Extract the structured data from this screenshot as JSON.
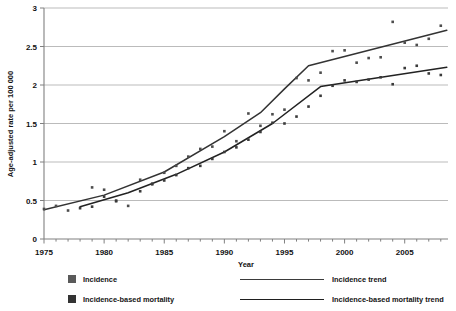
{
  "chart_data": {
    "type": "scatter",
    "title": "",
    "xlabel": "Year",
    "ylabel": "Age-adjusted rate per 100 000",
    "xlim": [
      1975,
      2008.6
    ],
    "ylim": [
      0,
      3
    ],
    "ytick_values": [
      0,
      0.5,
      1,
      1.5,
      2,
      2.5,
      3
    ],
    "ytick_labels": [
      "0",
      "0.5",
      "1",
      "1.5",
      "2",
      "2.5",
      "3"
    ],
    "xtick_values": [
      1975,
      1980,
      1985,
      1990,
      1995,
      2000,
      2005
    ],
    "xtick_labels": [
      "1975",
      "1980",
      "1985",
      "1990",
      "1995",
      "2000",
      "2005"
    ],
    "x_minor_step": 1,
    "grid": "horizontal",
    "legend_position": "bottom",
    "colors": {
      "incidence_marker": "#4d4d4d",
      "mortality_marker": "#3a3a3a",
      "incidence_trend": "#333333",
      "mortality_trend": "#222222",
      "gridline": "#b3b3b3",
      "axis": "#808080",
      "background": "#ffffff"
    },
    "series": [
      {
        "name": "Incidence",
        "kind": "scatter",
        "x": [
          1975,
          1976,
          1977,
          1979,
          1980,
          1981,
          1982,
          1983,
          1984,
          1985,
          1986,
          1987,
          1988,
          1989,
          1990,
          1991,
          1992,
          1993,
          1994,
          1995,
          1996,
          1997,
          1998,
          1999,
          2000,
          2001,
          2002,
          2003,
          2004,
          2005,
          2006,
          2007,
          2008
        ],
        "y": [
          0.39,
          0.43,
          0.37,
          0.67,
          0.64,
          0.5,
          0.43,
          0.77,
          0.72,
          0.86,
          0.95,
          1.07,
          1.17,
          1.2,
          1.4,
          1.27,
          1.63,
          1.47,
          1.62,
          1.68,
          2.09,
          2.06,
          2.16,
          2.44,
          2.45,
          2.29,
          2.35,
          2.36,
          2.82,
          2.55,
          2.52,
          2.6,
          2.77
        ]
      },
      {
        "name": "Incidence-based mortality",
        "kind": "scatter",
        "x": [
          1978,
          1979,
          1980,
          1981,
          1983,
          1984,
          1985,
          1986,
          1987,
          1988,
          1989,
          1990,
          1991,
          1992,
          1993,
          1994,
          1995,
          1996,
          1997,
          1998,
          1999,
          2000,
          2001,
          2002,
          2003,
          2004,
          2005,
          2006,
          2007,
          2008
        ],
        "y": [
          0.4,
          0.42,
          0.55,
          0.49,
          0.62,
          0.71,
          0.76,
          0.83,
          0.92,
          0.95,
          1.04,
          1.13,
          1.19,
          1.29,
          1.39,
          1.51,
          1.5,
          1.59,
          1.72,
          1.86,
          1.99,
          2.06,
          2.04,
          2.07,
          2.1,
          2.01,
          2.22,
          2.25,
          2.15,
          2.13
        ]
      },
      {
        "name": "Incidence trend",
        "kind": "line",
        "x": [
          1975,
          1980,
          1985,
          1990,
          1993,
          1995,
          1997,
          2008.5
        ],
        "y": [
          0.38,
          0.57,
          0.87,
          1.33,
          1.64,
          1.95,
          2.25,
          2.71
        ]
      },
      {
        "name": "Incidence-based mortality trend",
        "kind": "line",
        "x": [
          1978,
          1982,
          1986,
          1990,
          1994,
          1998,
          2008.5
        ],
        "y": [
          0.42,
          0.6,
          0.84,
          1.13,
          1.5,
          1.98,
          2.23
        ]
      }
    ]
  },
  "legend": {
    "items": [
      {
        "label": "Incidence",
        "marker": "square",
        "color": "#5a5a5a"
      },
      {
        "label": "Incidence trend",
        "marker": "line",
        "color": "#3b3b3b"
      },
      {
        "label": "Incidence-based mortality",
        "marker": "square",
        "color": "#333333"
      },
      {
        "label": "Incidence-based mortality trend",
        "marker": "line",
        "color": "#1f1f1f"
      }
    ]
  }
}
